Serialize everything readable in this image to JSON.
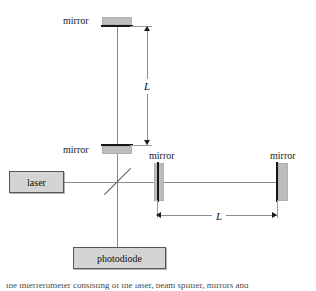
{
  "figure": {
    "labels": {
      "mirror_top": "mirror",
      "mirror_mid": "mirror",
      "mirror_right_near": "mirror",
      "mirror_right_far": "mirror",
      "laser": "laser",
      "photodiode": "photodiode",
      "length_vertical": "L",
      "length_horizontal": "L"
    },
    "caption_partial": "the interferometer consisting of the laser, beam splitter, mirrors and",
    "colors": {
      "beam": "#8a8a8a",
      "mirror_body": "#bdbdbd",
      "mirror_face": "#171717",
      "box_fill": "#d4d4d4",
      "box_border": "#555555",
      "text": "#111111"
    }
  }
}
